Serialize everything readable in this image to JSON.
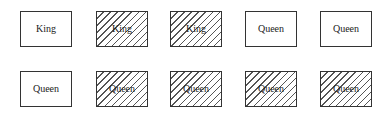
{
  "diagram": {
    "rows": [
      {
        "cards": [
          {
            "label": "King",
            "hatched": false
          },
          {
            "label": "King",
            "hatched": true
          },
          {
            "label": "King",
            "hatched": true
          },
          {
            "label": "Queen",
            "hatched": false
          },
          {
            "label": "Queen",
            "hatched": false
          }
        ]
      },
      {
        "cards": [
          {
            "label": "Queen",
            "hatched": false
          },
          {
            "label": "Queen",
            "hatched": true
          },
          {
            "label": "Queen",
            "hatched": true
          },
          {
            "label": "Queen",
            "hatched": true
          },
          {
            "label": "Queen",
            "hatched": true
          }
        ]
      }
    ],
    "colors": {
      "border": "#333333",
      "hatch": "#555555",
      "background": "#ffffff"
    }
  }
}
